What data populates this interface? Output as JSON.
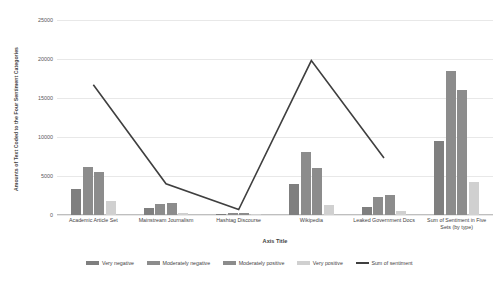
{
  "chart_data": {
    "type": "bar",
    "title": "",
    "xlabel": "Axis Title",
    "ylabel": "Amounts of Text Coded to the Four Sentiment Categories",
    "ylim": [
      0,
      25000
    ],
    "ytick_step": 5000,
    "yticks": [
      "0",
      "5000",
      "10000",
      "15000",
      "20000",
      "25000"
    ],
    "grid": true,
    "legend_position": "bottom",
    "categories": [
      "Academic Article Set",
      "Mainstream Journalism",
      "Hashtag Discourse",
      "Wikipedia",
      "Leaked Government Docs",
      "Sum of Sentiment  in Five Sets (by type)"
    ],
    "series": [
      {
        "name": "Very negative",
        "type": "bar",
        "color": "#7f7f7f",
        "values": [
          3300,
          900,
          150,
          4000,
          1000,
          9500
        ]
      },
      {
        "name": "Moderately negative",
        "type": "bar",
        "color": "#8c8c8c",
        "values": [
          6100,
          1400,
          300,
          8100,
          2300,
          18500
        ]
      },
      {
        "name": "Moderately positive",
        "type": "bar",
        "color": "#8c8c8c",
        "values": [
          5500,
          1500,
          250,
          6000,
          2600,
          16000
        ]
      },
      {
        "name": "Very positive",
        "type": "bar",
        "color": "#d0d0d0",
        "values": [
          1800,
          300,
          100,
          1300,
          500,
          4200
        ]
      },
      {
        "name": "Sum of sentiment",
        "type": "line",
        "color": "#3f3f3f",
        "values": [
          16700,
          4000,
          700,
          19800,
          7300,
          null
        ]
      }
    ]
  },
  "legend": {
    "items": [
      {
        "label": "Very negative",
        "color": "#7f7f7f",
        "kind": "bar"
      },
      {
        "label": "Moderately negative",
        "color": "#8c8c8c",
        "kind": "bar"
      },
      {
        "label": "Moderately positive",
        "color": "#8c8c8c",
        "kind": "bar"
      },
      {
        "label": "Very positive",
        "color": "#d0d0d0",
        "kind": "bar"
      },
      {
        "label": "Sum of sentiment",
        "color": "#3f3f3f",
        "kind": "line"
      }
    ]
  }
}
